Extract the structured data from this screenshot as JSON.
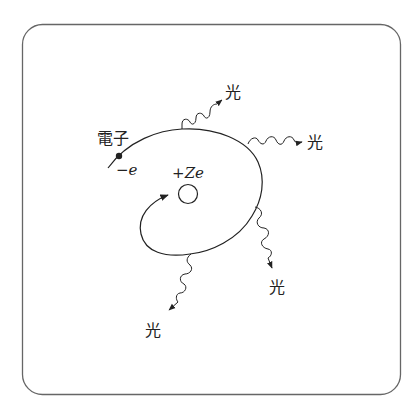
{
  "figure": {
    "frame": {
      "x": 22,
      "y": 24,
      "width": 379,
      "height": 371,
      "radius": 20,
      "stroke": "#666666"
    },
    "stroke_color": "#222222",
    "nucleus": {
      "label_prefix": "+",
      "label_var": "Ze",
      "cx": 188,
      "cy": 194,
      "r": 10
    },
    "electron": {
      "label": "電子",
      "charge_prefix": "−",
      "charge_var": "e",
      "dot": {
        "cx": 119,
        "cy": 156
      }
    },
    "photons": [
      {
        "label": "光",
        "id": "photon-top"
      },
      {
        "label": "光",
        "id": "photon-right"
      },
      {
        "label": "光",
        "id": "photon-lower-right"
      },
      {
        "label": "光",
        "id": "photon-bottom"
      }
    ]
  }
}
